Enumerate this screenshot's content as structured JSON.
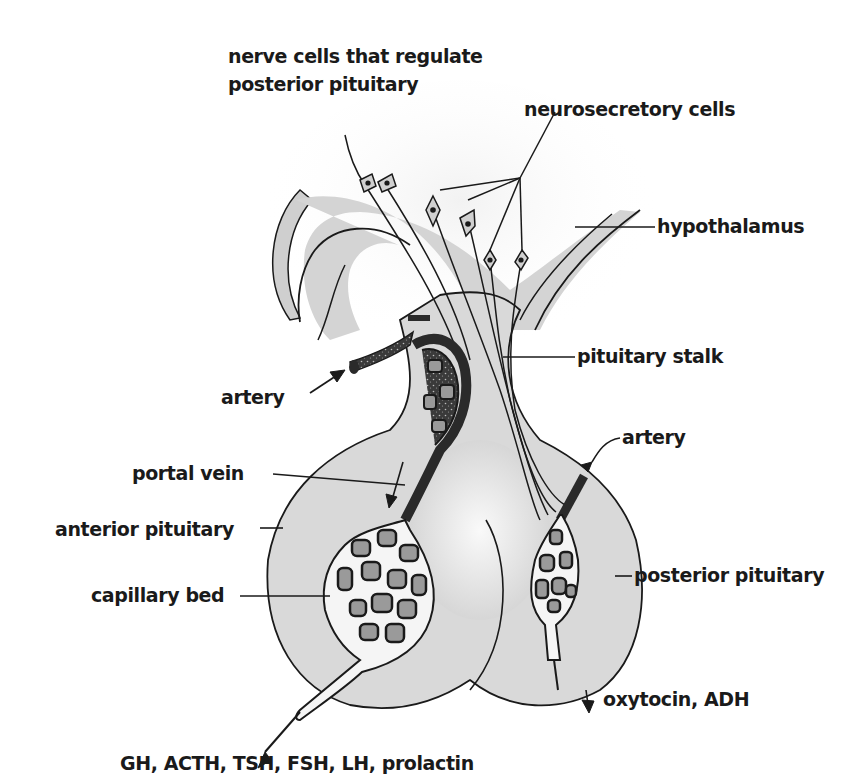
{
  "diagram": {
    "labels": {
      "nerve_cells_line1": "nerve cells that regulate",
      "nerve_cells_line2": "posterior pituitary",
      "neurosecretory_cells": "neurosecretory cells",
      "hypothalamus": "hypothalamus",
      "pituitary_stalk": "pituitary stalk",
      "artery_left": "artery",
      "artery_right": "artery",
      "portal_vein": "portal vein",
      "anterior_pituitary": "anterior pituitary",
      "capillary_bed": "capillary bed",
      "posterior_pituitary": "posterior pituitary",
      "posterior_output": "oxytocin, ADH",
      "anterior_output": "GH, ACTH, TSH, FSH, LH, prolactin"
    },
    "colors": {
      "tissue_fill": "#d9d9d9",
      "tissue_light": "#ececec",
      "vessel_dark": "#2a2a2a",
      "capillary_cell": "#8f8f8f",
      "outline": "#1a1a1a",
      "text": "#1a1a1a"
    }
  }
}
